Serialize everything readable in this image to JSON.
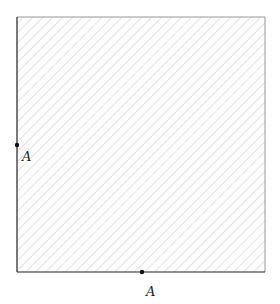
{
  "diagram": {
    "region": {
      "shape": "square",
      "fill": "hatched",
      "hatch_color": "#c8c8c8",
      "solid_edges": [
        "left",
        "bottom"
      ],
      "faint_edges": [
        "top",
        "right"
      ],
      "solid_edge_color": "#222222",
      "faint_edge_color": "#999999"
    },
    "points": [
      {
        "id": "left-point",
        "label": "A",
        "edge": "left"
      },
      {
        "id": "bottom-point",
        "label": "A",
        "edge": "bottom"
      }
    ]
  }
}
